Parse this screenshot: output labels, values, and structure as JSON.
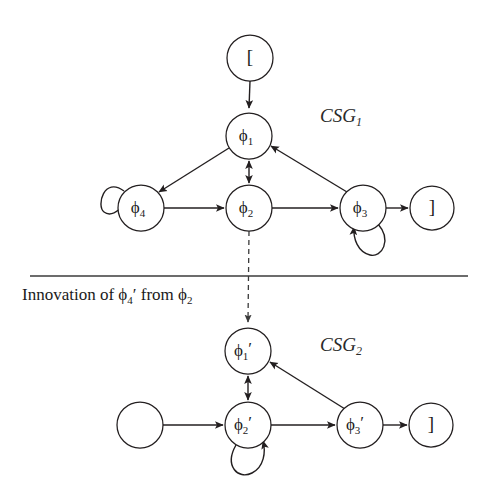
{
  "figure": {
    "separator_caption": "Innovation of ϕ₄′ from ϕ₂",
    "caption_parts": {
      "prefix": "Innovation of ",
      "symbol1_base": "ϕ",
      "symbol1_sub": "4",
      "symbol1_prime": "′",
      "middle": " from ",
      "symbol2_base": "ϕ",
      "symbol2_sub": "2"
    },
    "colors": {
      "stroke": "#231f20",
      "dashed_stroke": "#3a3a3a",
      "separator": "#3b3b3b",
      "node_fill": "#ffffff",
      "background": "#ffffff",
      "text": "#1a1a1a"
    }
  },
  "graphs": [
    {
      "id": "CSG1",
      "label_base": "CSG",
      "label_sub": "1",
      "label_full": "CSG₁",
      "nodes": [
        {
          "id": "start1",
          "label": "[",
          "base": "[",
          "sub": "",
          "prime": "",
          "cx": 250,
          "cy": 58,
          "r": 23
        },
        {
          "id": "phi1",
          "label": "ϕ₁",
          "base": "ϕ",
          "sub": "1",
          "prime": "",
          "cx": 249,
          "cy": 136,
          "r": 23
        },
        {
          "id": "phi4",
          "label": "ϕ₄",
          "base": "ϕ",
          "sub": "4",
          "prime": "",
          "cx": 141,
          "cy": 208,
          "r": 23
        },
        {
          "id": "phi2",
          "label": "ϕ₂",
          "base": "ϕ",
          "sub": "2",
          "prime": "",
          "cx": 249,
          "cy": 208,
          "r": 23
        },
        {
          "id": "phi3",
          "label": "ϕ₃",
          "base": "ϕ",
          "sub": "3",
          "prime": "",
          "cx": 363,
          "cy": 208,
          "r": 23
        },
        {
          "id": "end1",
          "label": "]",
          "base": "]",
          "sub": "",
          "prime": "",
          "cx": 432,
          "cy": 208,
          "r": 22
        }
      ],
      "edges": [
        {
          "from": "start1",
          "to": "phi1",
          "kind": "straight",
          "arrow": "forward"
        },
        {
          "from": "phi1",
          "to": "phi4",
          "kind": "straight",
          "arrow": "forward"
        },
        {
          "from": "phi1",
          "to": "phi2",
          "kind": "straight",
          "arrow": "both"
        },
        {
          "from": "phi3",
          "to": "phi1",
          "kind": "straight",
          "arrow": "forward"
        },
        {
          "from": "phi4",
          "to": "phi2",
          "kind": "straight",
          "arrow": "forward"
        },
        {
          "from": "phi2",
          "to": "phi3",
          "kind": "straight",
          "arrow": "forward"
        },
        {
          "from": "phi3",
          "to": "end1",
          "kind": "straight",
          "arrow": "forward"
        },
        {
          "from": "phi4",
          "to": "phi4",
          "kind": "self-loop",
          "arrow": "forward",
          "position": "upper-left"
        },
        {
          "from": "phi3",
          "to": "phi3",
          "kind": "self-loop",
          "arrow": "forward",
          "position": "lower-right"
        }
      ]
    },
    {
      "id": "CSG2",
      "label_base": "CSG",
      "label_sub": "2",
      "label_full": "CSG₂",
      "nodes": [
        {
          "id": "blank2",
          "label": "",
          "base": "",
          "sub": "",
          "prime": "",
          "cx": 140,
          "cy": 425,
          "r": 23
        },
        {
          "id": "phi1p",
          "label": "ϕ₁′",
          "base": "ϕ",
          "sub": "1",
          "prime": "′",
          "cx": 248,
          "cy": 351,
          "r": 23
        },
        {
          "id": "phi2p",
          "label": "ϕ₂′",
          "base": "ϕ",
          "sub": "2",
          "prime": "′",
          "cx": 248,
          "cy": 425,
          "r": 23
        },
        {
          "id": "phi3p",
          "label": "ϕ₃′",
          "base": "ϕ",
          "sub": "3",
          "prime": "′",
          "cx": 360,
          "cy": 425,
          "r": 23
        },
        {
          "id": "end2",
          "label": "]",
          "base": "]",
          "sub": "",
          "prime": "",
          "cx": 431,
          "cy": 425,
          "r": 22
        }
      ],
      "edges": [
        {
          "from": "blank2",
          "to": "phi2p",
          "kind": "straight",
          "arrow": "forward"
        },
        {
          "from": "phi1p",
          "to": "phi2p",
          "kind": "straight",
          "arrow": "both"
        },
        {
          "from": "phi3p",
          "to": "phi1p",
          "kind": "straight",
          "arrow": "forward"
        },
        {
          "from": "phi2p",
          "to": "phi3p",
          "kind": "straight",
          "arrow": "forward"
        },
        {
          "from": "phi3p",
          "to": "end2",
          "kind": "straight",
          "arrow": "forward"
        },
        {
          "from": "phi2p",
          "to": "phi2p",
          "kind": "self-loop",
          "arrow": "forward",
          "position": "lower-right"
        }
      ]
    }
  ],
  "cross_link": {
    "from": "phi2",
    "to": "phi1p",
    "kind": "dashed",
    "arrow": "forward",
    "description": "innovation link"
  },
  "separator": {
    "x1": 30,
    "x2": 468,
    "y": 276
  },
  "labels": {
    "csg1_x": 320,
    "csg1_y": 118,
    "csg2_x": 320,
    "csg2_y": 347,
    "caption_x": 22,
    "caption_y": 296
  }
}
